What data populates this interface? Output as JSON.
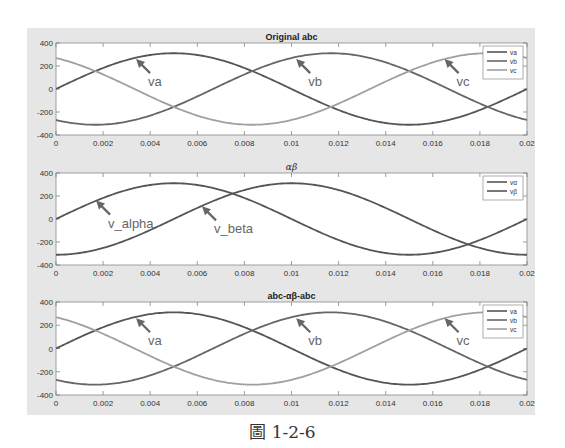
{
  "figure": {
    "caption": "圖 1-2-6",
    "background_color": "#e6e6e6",
    "plot_color": "#ffffff"
  },
  "chart_data": [
    {
      "type": "line",
      "title": "Original abc",
      "title_bold": true,
      "xlabel": "",
      "ylabel": "",
      "xlim": [
        0,
        0.02
      ],
      "ylim": [
        -400,
        400
      ],
      "xticks": [
        0,
        0.002,
        0.004,
        0.006,
        0.008,
        0.01,
        0.012,
        0.014,
        0.016,
        0.018,
        0.02
      ],
      "xtick_labels": [
        "0",
        "0.002",
        "0.004",
        "0.006",
        "0.008",
        "0.01",
        "0.012",
        "0.014",
        "0.016",
        "0.018",
        "0.02"
      ],
      "yticks": [
        -400,
        -200,
        0,
        200,
        400
      ],
      "ytick_labels": [
        "-400",
        "-200",
        "0",
        "200",
        "400"
      ],
      "grid": false,
      "legend": {
        "position": "upper right",
        "entries": [
          "va",
          "vb",
          "vc"
        ]
      },
      "series": [
        {
          "name": "va",
          "color": "#555555",
          "amplitude": 311,
          "frequency_hz": 50,
          "phase_deg": 0,
          "func": "sin",
          "x": [
            0,
            0.002,
            0.004,
            0.005,
            0.006,
            0.008,
            0.01,
            0.012,
            0.014,
            0.015,
            0.016,
            0.018,
            0.02
          ],
          "values": [
            0,
            183,
            296,
            311,
            296,
            183,
            0,
            -183,
            -296,
            -311,
            -296,
            -183,
            0
          ]
        },
        {
          "name": "vb",
          "color": "#666666",
          "amplitude": 311,
          "frequency_hz": 50,
          "phase_deg": -120,
          "func": "sin",
          "x": [
            0,
            0.002,
            0.004,
            0.006,
            0.008,
            0.01,
            0.012,
            0.014,
            0.016,
            0.018,
            0.02
          ],
          "values": [
            -269,
            -309,
            -212,
            -32,
            154,
            269,
            309,
            212,
            32,
            -154,
            -269
          ]
        },
        {
          "name": "vc",
          "color": "#a0a0a0",
          "amplitude": 311,
          "frequency_hz": 50,
          "phase_deg": 120,
          "func": "sin",
          "x": [
            0,
            0.002,
            0.004,
            0.006,
            0.008,
            0.01,
            0.012,
            0.014,
            0.016,
            0.018,
            0.02
          ],
          "values": [
            269,
            126,
            -84,
            -264,
            -309,
            -269,
            -126,
            84,
            264,
            309,
            269
          ]
        }
      ],
      "annotations": [
        {
          "text": "va",
          "arrow_tip": [
            0.0034,
            260
          ],
          "label_pos": [
            0.0038,
            120
          ]
        },
        {
          "text": "vb",
          "arrow_tip": [
            0.0102,
            260
          ],
          "label_pos": [
            0.0106,
            120
          ]
        },
        {
          "text": "vc",
          "arrow_tip": [
            0.0165,
            260
          ],
          "label_pos": [
            0.0169,
            120
          ]
        }
      ]
    },
    {
      "type": "line",
      "title": "αβ",
      "title_bold": false,
      "title_italic": true,
      "xlabel": "",
      "ylabel": "",
      "xlim": [
        0,
        0.02
      ],
      "ylim": [
        -400,
        400
      ],
      "xticks": [
        0,
        0.002,
        0.004,
        0.006,
        0.008,
        0.01,
        0.012,
        0.014,
        0.016,
        0.018,
        0.02
      ],
      "xtick_labels": [
        "0",
        "0.002",
        "0.004",
        "0.006",
        "0.008",
        "0.01",
        "0.012",
        "0.014",
        "0.016",
        "0.018",
        "0.02"
      ],
      "yticks": [
        -400,
        -200,
        0,
        200,
        400
      ],
      "ytick_labels": [
        "-400",
        "-200",
        "0",
        "200",
        "400"
      ],
      "grid": false,
      "legend": {
        "position": "upper right",
        "entries": [
          "vα",
          "vβ"
        ]
      },
      "series": [
        {
          "name": "v_alpha",
          "legend_label": "vα",
          "color": "#555555",
          "amplitude": 311,
          "frequency_hz": 50,
          "phase_deg": 0,
          "func": "sin",
          "x": [
            0,
            0.002,
            0.004,
            0.005,
            0.006,
            0.008,
            0.01,
            0.012,
            0.014,
            0.015,
            0.016,
            0.018,
            0.02
          ],
          "values": [
            0,
            183,
            296,
            311,
            296,
            183,
            0,
            -183,
            -296,
            -311,
            -296,
            -183,
            0
          ]
        },
        {
          "name": "v_beta",
          "legend_label": "vβ",
          "color": "#555555",
          "amplitude": 311,
          "frequency_hz": 50,
          "phase_deg": -90,
          "func": "sin",
          "x": [
            0,
            0.002,
            0.004,
            0.006,
            0.008,
            0.01,
            0.012,
            0.014,
            0.016,
            0.018,
            0.02
          ],
          "values": [
            -311,
            -252,
            -96,
            96,
            252,
            311,
            252,
            96,
            -96,
            -252,
            -311
          ]
        }
      ],
      "annotations": [
        {
          "text": "v_alpha",
          "arrow_tip": [
            0.0017,
            160
          ],
          "label_pos": [
            0.0018,
            -20
          ]
        },
        {
          "text": "v_beta",
          "arrow_tip": [
            0.0062,
            110
          ],
          "label_pos": [
            0.0065,
            -70
          ]
        }
      ]
    },
    {
      "type": "line",
      "title": "abc-αβ-abc",
      "title_bold": true,
      "xlabel": "",
      "ylabel": "",
      "xlim": [
        0,
        0.02
      ],
      "ylim": [
        -400,
        400
      ],
      "xticks": [
        0,
        0.002,
        0.004,
        0.006,
        0.008,
        0.01,
        0.012,
        0.014,
        0.016,
        0.018,
        0.02
      ],
      "xtick_labels": [
        "0",
        "0.002",
        "0.004",
        "0.006",
        "0.008",
        "0.01",
        "0.012",
        "0.014",
        "0.016",
        "0.018",
        "0.02"
      ],
      "yticks": [
        -400,
        -200,
        0,
        200,
        400
      ],
      "ytick_labels": [
        "-400",
        "-200",
        "0",
        "200",
        "400"
      ],
      "grid": false,
      "legend": {
        "position": "upper right",
        "entries": [
          "va",
          "vb",
          "vc"
        ]
      },
      "series": [
        {
          "name": "va",
          "color": "#555555",
          "amplitude": 311,
          "frequency_hz": 50,
          "phase_deg": 0,
          "func": "sin",
          "x": [
            0,
            0.002,
            0.004,
            0.005,
            0.006,
            0.008,
            0.01,
            0.012,
            0.014,
            0.015,
            0.016,
            0.018,
            0.02
          ],
          "values": [
            0,
            183,
            296,
            311,
            296,
            183,
            0,
            -183,
            -296,
            -311,
            -296,
            -183,
            0
          ]
        },
        {
          "name": "vb",
          "color": "#666666",
          "amplitude": 311,
          "frequency_hz": 50,
          "phase_deg": -120,
          "func": "sin",
          "x": [
            0,
            0.002,
            0.004,
            0.006,
            0.008,
            0.01,
            0.012,
            0.014,
            0.016,
            0.018,
            0.02
          ],
          "values": [
            -269,
            -309,
            -212,
            -32,
            154,
            269,
            309,
            212,
            32,
            -154,
            -269
          ]
        },
        {
          "name": "vc",
          "color": "#a0a0a0",
          "amplitude": 311,
          "frequency_hz": 50,
          "phase_deg": 120,
          "func": "sin",
          "x": [
            0,
            0.002,
            0.004,
            0.006,
            0.008,
            0.01,
            0.012,
            0.014,
            0.016,
            0.018,
            0.02
          ],
          "values": [
            269,
            126,
            -84,
            -264,
            -309,
            -269,
            -126,
            84,
            264,
            309,
            269
          ]
        }
      ],
      "annotations": [
        {
          "text": "va",
          "arrow_tip": [
            0.0034,
            260
          ],
          "label_pos": [
            0.0038,
            120
          ]
        },
        {
          "text": "vb",
          "arrow_tip": [
            0.0102,
            260
          ],
          "label_pos": [
            0.0106,
            120
          ]
        },
        {
          "text": "vc",
          "arrow_tip": [
            0.0165,
            260
          ],
          "label_pos": [
            0.0169,
            120
          ]
        }
      ]
    }
  ]
}
